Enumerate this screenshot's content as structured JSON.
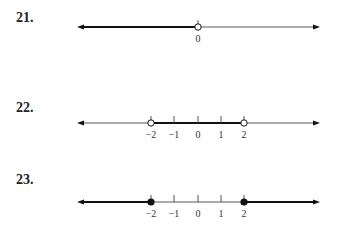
{
  "problems": [
    {
      "number": "21.",
      "line": {
        "y": 27,
        "x_start": 77,
        "x_end": 320
      },
      "ticks": [
        {
          "value": 0,
          "x": 198,
          "label": "0"
        }
      ],
      "thick_segments": [
        {
          "from_x": 77,
          "to_x": 198,
          "arrow_left": true
        }
      ],
      "endpoints": [
        {
          "x": 198,
          "type": "open"
        }
      ]
    },
    {
      "number": "22.",
      "line": {
        "y": 123,
        "x_start": 77,
        "x_end": 320
      },
      "ticks": [
        {
          "value": -2,
          "x": 151,
          "label": "−2"
        },
        {
          "value": -1,
          "x": 174,
          "label": "−1"
        },
        {
          "value": 0,
          "x": 198,
          "label": "0"
        },
        {
          "value": 1,
          "x": 221,
          "label": "1"
        },
        {
          "value": 2,
          "x": 244,
          "label": "2"
        }
      ],
      "thick_segments": [
        {
          "from_x": 151,
          "to_x": 244
        }
      ],
      "endpoints": [
        {
          "x": 151,
          "type": "open"
        },
        {
          "x": 244,
          "type": "open"
        }
      ]
    },
    {
      "number": "23.",
      "line": {
        "y": 202,
        "x_start": 77,
        "x_end": 320
      },
      "ticks": [
        {
          "value": -2,
          "x": 151,
          "label": "−2"
        },
        {
          "value": -1,
          "x": 174,
          "label": "−1"
        },
        {
          "value": 0,
          "x": 198,
          "label": "0"
        },
        {
          "value": 1,
          "x": 221,
          "label": "1"
        },
        {
          "value": 2,
          "x": 244,
          "label": "2"
        }
      ],
      "thick_segments": [
        {
          "from_x": 77,
          "to_x": 151,
          "arrow_left": true
        },
        {
          "from_x": 244,
          "to_x": 320,
          "arrow_right": true
        }
      ],
      "endpoints": [
        {
          "x": 151,
          "type": "closed"
        },
        {
          "x": 244,
          "type": "closed"
        }
      ]
    }
  ],
  "colors": {
    "line": "#555555",
    "thick": "#111111",
    "text": "#222222"
  }
}
